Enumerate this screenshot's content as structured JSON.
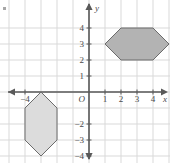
{
  "figure": {
    "type": "coordinate-grid",
    "background": "#ffffff",
    "grid": {
      "spacing_px": 16,
      "color": "#d9d9d9",
      "origin_px": {
        "x": 89,
        "y": 92
      },
      "x_range": [
        -5.5,
        5.0
      ],
      "y_range": [
        -4.5,
        4.5
      ],
      "visible": true
    },
    "axes": {
      "color": "#595959",
      "arrowheads": [
        "left",
        "right",
        "up",
        "down"
      ],
      "x_axis_label": "x",
      "y_axis_label": "y",
      "origin_label": "O"
    },
    "x_tick_labels": [
      {
        "value": -4,
        "text": "−4"
      },
      {
        "value": 1,
        "text": "1"
      },
      {
        "value": 2,
        "text": "2"
      },
      {
        "value": 3,
        "text": "3"
      },
      {
        "value": 4,
        "text": "4"
      }
    ],
    "y_tick_labels": [
      {
        "value": 4,
        "text": "4"
      },
      {
        "value": 3,
        "text": "3"
      },
      {
        "value": 2,
        "text": "2"
      },
      {
        "value": 1,
        "text": "1"
      },
      {
        "value": -2,
        "text": "−2"
      },
      {
        "value": -3,
        "text": "−3"
      },
      {
        "value": -4,
        "text": "−4"
      }
    ],
    "shapes": [
      {
        "name": "upper-hexagon",
        "orientation": "horizontal",
        "fill": "#b3b3b3",
        "stroke": "#6b6b6b",
        "vertices": [
          {
            "x": 1,
            "y": 3
          },
          {
            "x": 2,
            "y": 4
          },
          {
            "x": 4,
            "y": 4
          },
          {
            "x": 5,
            "y": 3
          },
          {
            "x": 4,
            "y": 2
          },
          {
            "x": 2,
            "y": 2
          }
        ]
      },
      {
        "name": "lower-hexagon",
        "orientation": "vertical",
        "fill": "#dcdcdc",
        "stroke": "#6b6b6b",
        "vertices": [
          {
            "x": -3,
            "y": 0
          },
          {
            "x": -2,
            "y": -1
          },
          {
            "x": -2,
            "y": -3
          },
          {
            "x": -3,
            "y": -4
          },
          {
            "x": -4,
            "y": -3
          },
          {
            "x": -4,
            "y": -1
          }
        ]
      }
    ],
    "bullet_mark": {
      "present": true,
      "color": "#8a8a8a"
    }
  }
}
